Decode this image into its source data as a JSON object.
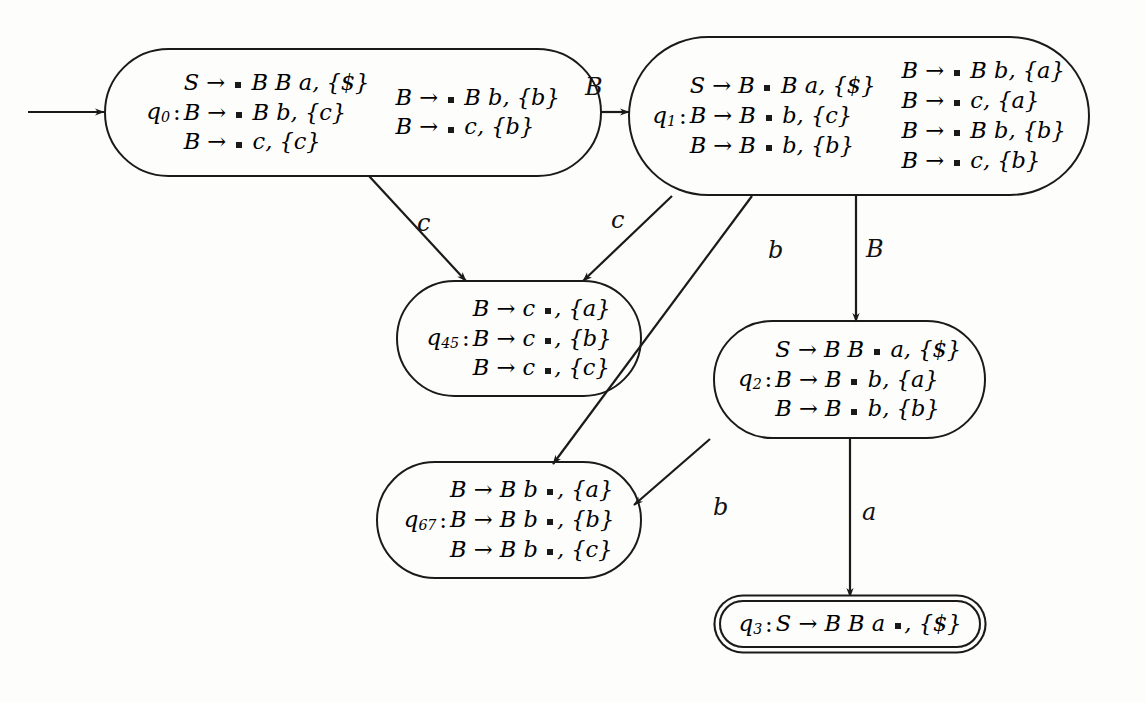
{
  "diagram": {
    "start_marker": "start-arrow"
  },
  "states": [
    {
      "id": "q0",
      "name": "q",
      "sub": "0",
      "final": false,
      "columns": [
        [
          {
            "lhs": "S",
            "arrow": "→",
            "before": "",
            "after": "BBa",
            "dot_pos": "before",
            "lookahead": "{$}",
            "text": "S → ▪ B B a, {$}"
          },
          {
            "lhs": "B",
            "arrow": "→",
            "before": "",
            "after": "B b",
            "dot_pos": "before",
            "lookahead": "{c}",
            "text": "B → ▪ B b, {c}"
          },
          {
            "lhs": "B",
            "arrow": "→",
            "before": "",
            "after": "c",
            "dot_pos": "before",
            "lookahead": "{c}",
            "text": "B → ▪ c, {c}"
          }
        ],
        [
          {
            "lhs": "B",
            "arrow": "→",
            "before": "",
            "after": "B b",
            "dot_pos": "before",
            "lookahead": "{b}",
            "text": "B → ▪ B b, {b}"
          },
          {
            "lhs": "B",
            "arrow": "→",
            "before": "",
            "after": "c",
            "dot_pos": "before",
            "lookahead": "{b}",
            "text": "B → ▪ c, {b}"
          }
        ]
      ]
    },
    {
      "id": "q1",
      "name": "q",
      "sub": "1",
      "final": false,
      "columns": [
        [
          {
            "text": "S → B ▪ B a, {$}"
          },
          {
            "text": "B → B ▪ b, {c}"
          },
          {
            "text": "B → B ▪ b, {b}"
          }
        ],
        [
          {
            "text": "B → ▪ B b, {a}"
          },
          {
            "text": "B → ▪ c, {a}"
          },
          {
            "text": "B → ▪ B b, {b}"
          },
          {
            "text": "B → ▪ c, {b}"
          }
        ]
      ]
    },
    {
      "id": "q45",
      "name": "q",
      "sub": "45",
      "final": false,
      "columns": [
        [
          {
            "text": "B → c ▪, {a}"
          },
          {
            "text": "B → c ▪, {b}"
          },
          {
            "text": "B → c ▪, {c}"
          }
        ]
      ]
    },
    {
      "id": "q2",
      "name": "q",
      "sub": "2",
      "final": false,
      "columns": [
        [
          {
            "text": "S → B B ▪ a, {$}"
          },
          {
            "text": "B → B ▪ b, {a}"
          },
          {
            "text": "B → B ▪ b, {b}"
          }
        ]
      ]
    },
    {
      "id": "q67",
      "name": "q",
      "sub": "67",
      "final": false,
      "columns": [
        [
          {
            "text": "B → B b ▪, {a}"
          },
          {
            "text": "B → B b ▪, {b}"
          },
          {
            "text": "B → B b ▪, {c}"
          }
        ]
      ]
    },
    {
      "id": "q3",
      "name": "q",
      "sub": "3",
      "final": true,
      "columns": [
        [
          {
            "text": "S → B B a ▪, {$}"
          }
        ]
      ]
    }
  ],
  "transitions": [
    {
      "id": "t-q0-q1",
      "from": "q0",
      "to": "q1",
      "label": "B"
    },
    {
      "id": "t-q0-q45",
      "from": "q0",
      "to": "q45",
      "label": "c"
    },
    {
      "id": "t-q1-q45",
      "from": "q1",
      "to": "q45",
      "label": "c"
    },
    {
      "id": "t-q1-q67",
      "from": "q1",
      "to": "q67",
      "label": "b"
    },
    {
      "id": "t-q1-q2",
      "from": "q1",
      "to": "q2",
      "label": "B"
    },
    {
      "id": "t-q2-q67",
      "from": "q2",
      "to": "q67",
      "label": "b"
    },
    {
      "id": "t-q2-q3",
      "from": "q2",
      "to": "q3",
      "label": "a"
    }
  ],
  "labels": {
    "q0_q1": "B",
    "q0_q45": "c",
    "q1_q45": "c",
    "q1_q67": "b",
    "q1_q2": "B",
    "q2_q67": "b",
    "q2_q3": "a"
  },
  "colors": {
    "stroke": "#1a1a1a",
    "background": "#fdfdfc",
    "text": "#111111"
  }
}
